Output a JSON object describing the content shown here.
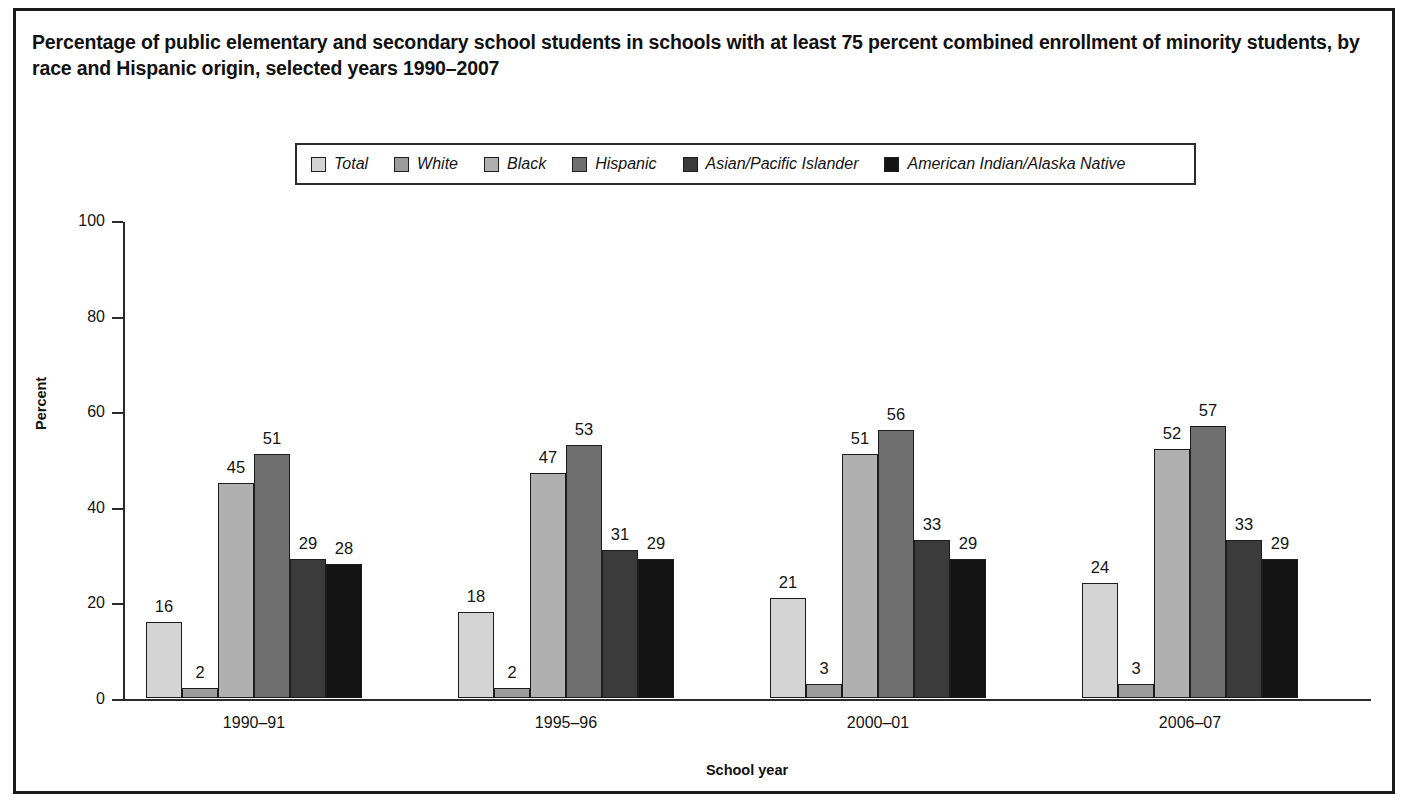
{
  "chart_data": {
    "type": "bar",
    "title": "Percentage of public elementary and secondary school students in schools with at least 75 percent combined enrollment of minority students, by race and Hispanic origin, selected years 1990–2007",
    "xlabel": "School year",
    "ylabel": "Percent",
    "ylim": [
      0,
      100
    ],
    "yticks": [
      0,
      20,
      40,
      60,
      80,
      100
    ],
    "grid": false,
    "legend_position": "top-center",
    "categories": [
      "1990–91",
      "1995–96",
      "2000–01",
      "2006–07"
    ],
    "series": [
      {
        "name": "Total",
        "color": "#d4d4d4",
        "values": [
          16,
          18,
          21,
          24
        ]
      },
      {
        "name": "White",
        "color": "#9c9c9c",
        "values": [
          2,
          2,
          3,
          3
        ]
      },
      {
        "name": "Black",
        "color": "#b0b0b0",
        "values": [
          45,
          47,
          51,
          52
        ]
      },
      {
        "name": "Hispanic",
        "color": "#6f6f6f",
        "values": [
          51,
          53,
          56,
          57
        ]
      },
      {
        "name": "Asian/Pacific Islander",
        "color": "#3b3b3b",
        "values": [
          29,
          31,
          33,
          33
        ]
      },
      {
        "name": "American Indian/Alaska Native",
        "color": "#141414",
        "values": [
          28,
          29,
          29,
          29
        ]
      }
    ]
  },
  "colors": {
    "frame": "#1b1b1b",
    "axis": "#2a2a2a",
    "text": "#141414",
    "bar_edge": "#1c1c1c"
  }
}
